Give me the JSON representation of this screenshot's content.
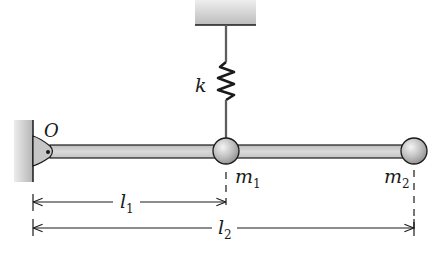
{
  "diagram": {
    "title": "",
    "labels": {
      "spring": "k",
      "pivot": "O",
      "mass1": {
        "base": "m",
        "sub": "1"
      },
      "mass2": {
        "base": "m",
        "sub": "2"
      },
      "length1": {
        "base": "l",
        "sub": "1"
      },
      "length2": {
        "base": "l",
        "sub": "2"
      }
    },
    "components": [
      {
        "id": "ceiling",
        "type": "fixed-support"
      },
      {
        "id": "spring",
        "type": "spring",
        "label": "k"
      },
      {
        "id": "wall",
        "type": "fixed-wall"
      },
      {
        "id": "pivot",
        "type": "pin-joint",
        "label": "O"
      },
      {
        "id": "rod",
        "type": "rigid-bar"
      },
      {
        "id": "m1",
        "type": "point-mass",
        "label": "m1"
      },
      {
        "id": "m2",
        "type": "point-mass",
        "label": "m2"
      }
    ],
    "dimensions": [
      {
        "label": "l1",
        "from": "O",
        "to": "m1"
      },
      {
        "label": "l2",
        "from": "O",
        "to": "m2"
      }
    ],
    "colors": {
      "ink": "#1a1a1a",
      "support": "#c8c8c8",
      "rod": "#d4d4d4",
      "ball": "#bdbdbd"
    }
  }
}
